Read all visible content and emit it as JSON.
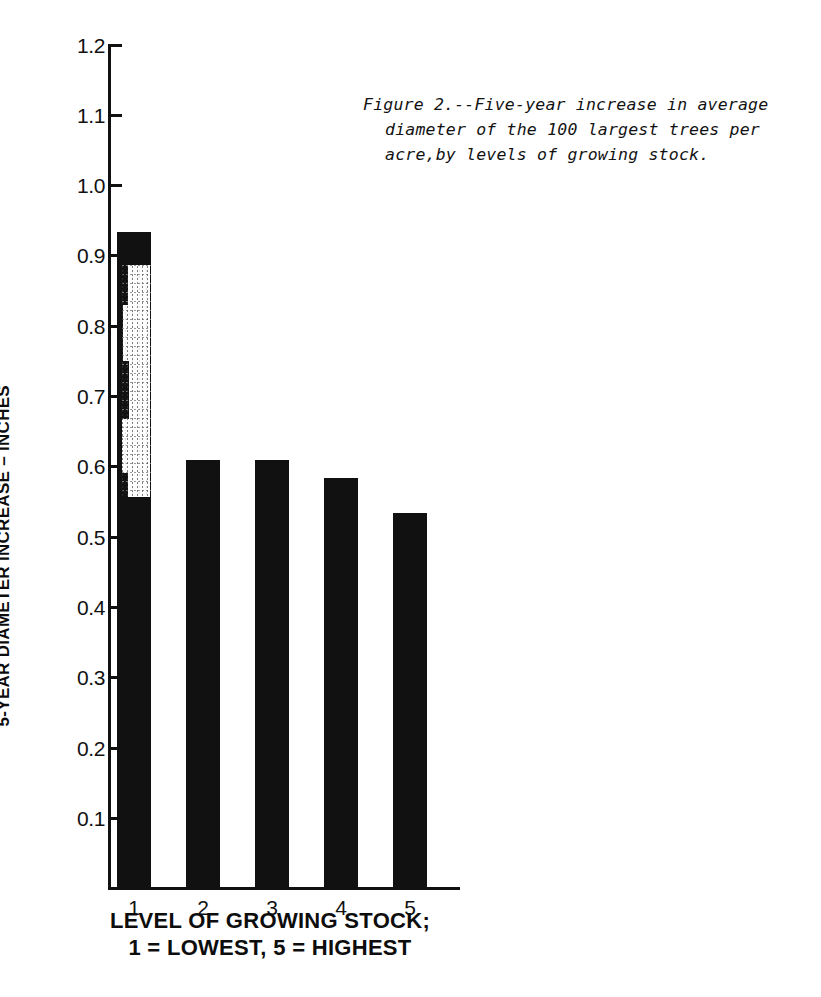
{
  "caption": {
    "line1": "Figure 2.--Five-year increase in average",
    "line2": "diameter of the 100 largest trees per",
    "line3": "acre,by levels of growing stock.",
    "full": "Figure 2.--Five-year increase in average diameter of the 100 largest trees per acre,by levels of growing stock."
  },
  "axes": {
    "ylabel": "5-YEAR DIAMETER INCREASE – INCHES",
    "xlabel_line1": "LEVEL OF GROWING STOCK;",
    "xlabel_line2": "1 = LOWEST,  5 = HIGHEST",
    "ytick_labels": [
      "1.2",
      "1.1",
      "1.0",
      "0.9",
      "0.8",
      "0.7",
      "0.6",
      "0.5",
      "0.4",
      "0.3",
      "0.2",
      "0.1"
    ],
    "xtick_labels": [
      "1",
      "2",
      "3",
      "4",
      "5"
    ]
  },
  "colors": {
    "bar": "#111111",
    "axis": "#111111",
    "background": "#ffffff",
    "artifact": "#fdfdfd"
  },
  "chart_data": {
    "type": "bar",
    "title": "Figure 2.--Five-year increase in average diameter of the 100 largest trees per acre,by levels of growing stock.",
    "xlabel": "LEVEL OF GROWING STOCK; 1 = LOWEST, 5 = HIGHEST",
    "ylabel": "5-YEAR DIAMETER INCREASE – INCHES",
    "categories": [
      "1",
      "2",
      "3",
      "4",
      "5"
    ],
    "values": [
      1.12,
      0.73,
      0.73,
      0.7,
      0.64
    ],
    "ylim": [
      0,
      1.2
    ],
    "ytick_step": 0.1,
    "yticks": [
      0.1,
      0.2,
      0.3,
      0.4,
      0.5,
      0.6,
      0.7,
      0.8,
      0.9,
      1.0,
      1.1,
      1.2
    ],
    "grid": false,
    "legend": "none",
    "bar_color": "#111111"
  }
}
